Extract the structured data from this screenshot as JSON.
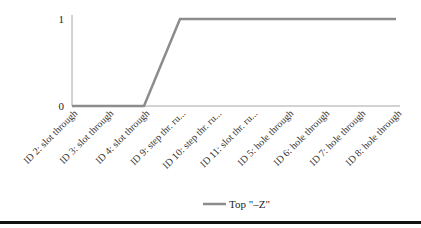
{
  "chart_data": {
    "type": "line",
    "title": "",
    "xlabel": "",
    "ylabel": "",
    "categories": [
      "ID 2: slot through",
      "ID 3: slot through",
      "ID 4: slot through",
      "ID 9: step thr. ru...",
      "ID 10: step thr. ru...",
      "ID 11: slot thr. ru...",
      "ID 5: hole through",
      "ID 6: hole through",
      "ID 7: hole through",
      "ID 8: hole through"
    ],
    "series": [
      {
        "name": "Top \"–Z\"",
        "values": [
          0,
          0,
          0,
          1,
          1,
          1,
          1,
          1,
          1,
          1
        ],
        "color": "#8c8c8c"
      }
    ],
    "ylim": [
      0,
      1
    ],
    "yticks": [
      "0",
      "1"
    ],
    "grid": false,
    "legend": "bottom-center"
  },
  "colors": {
    "axis": "#a6a6a6",
    "line": "#8c8c8c",
    "rule": "#111111"
  }
}
